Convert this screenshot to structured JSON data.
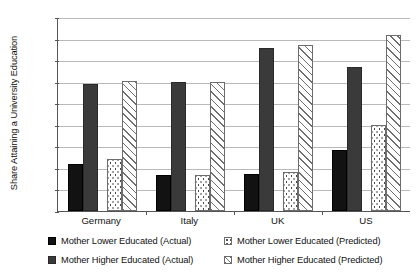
{
  "chart_data": {
    "type": "bar",
    "title": "",
    "subtitle": "",
    "xlabel": "",
    "ylabel": "Share Attaining a University Education",
    "categories": [
      "Germany",
      "Italy",
      "UK",
      "US"
    ],
    "ylim": [
      0,
      0.9
    ],
    "ytick_labels": [
      "0.9",
      "0.8",
      "0.7",
      "0.6",
      "0.5",
      "0.4",
      "0.3",
      "0.2",
      "0.1",
      "0"
    ],
    "ytick_values": [
      0.9,
      0.8,
      0.7,
      0.6,
      0.5,
      0.4,
      0.3,
      0.2,
      0.1,
      0
    ],
    "grid": "horizontal",
    "legend_position": "bottom",
    "series": [
      {
        "name": "Mother Lower Educated (Actual)",
        "key": "actual-low",
        "fill": "solid-black",
        "color": "#121212",
        "values": [
          0.22,
          0.165,
          0.17,
          0.285
        ]
      },
      {
        "name": "Mother Higher Educated (Actual)",
        "key": "actual-high",
        "fill": "solid-dark-gray",
        "color": "#3a3a3a",
        "values": [
          0.59,
          0.6,
          0.755,
          0.67
        ]
      },
      {
        "name": "Mother Lower Educated (Predicted)",
        "key": "pred-low",
        "fill": "dotted",
        "color": "#ffffff",
        "values": [
          0.24,
          0.165,
          0.18,
          0.4
        ]
      },
      {
        "name": "Mother Higher Educated (Predicted)",
        "key": "pred-high",
        "fill": "diagonal-hatch",
        "color": "#ffffff",
        "values": [
          0.605,
          0.6,
          0.77,
          0.815
        ]
      }
    ]
  },
  "axis": {
    "y_title": "Share Attaining a University Education"
  },
  "legend": {
    "items": [
      {
        "label": "Mother Lower Educated (Actual)",
        "swatch": "actual-low"
      },
      {
        "label": "Mother Lower Educated (Predicted)",
        "swatch": "pred-low"
      },
      {
        "label": "Mother Higher Educated (Actual)",
        "swatch": "actual-high"
      },
      {
        "label": "Mother Higher Educated (Predicted)",
        "swatch": "pred-high"
      }
    ]
  }
}
